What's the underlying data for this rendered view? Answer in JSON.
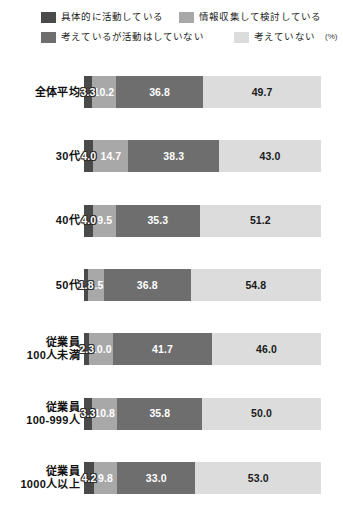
{
  "legend": {
    "items": [
      {
        "label": "具体的に活動している",
        "color": "#4a4a4a"
      },
      {
        "label": "情報収集して検討している",
        "color": "#a8a8a8"
      },
      {
        "label": "考えているが活動はしていない",
        "color": "#6e6e6e"
      },
      {
        "label": "考えていない",
        "color": "#dcdcdc"
      }
    ],
    "unit_note": "(%)"
  },
  "chart_data": {
    "type": "bar",
    "title": "",
    "subtype": "horizontal-100-percent-stacked",
    "xlabel": "",
    "ylabel": "",
    "unit": "%",
    "xlim": [
      0,
      100
    ],
    "grid": false,
    "legend_position": "top",
    "categories": [
      "全体平均",
      "30代",
      "40代",
      "50代",
      "従業員100人未満",
      "従業員100-999人",
      "従業員1000人以上"
    ],
    "category_lines": [
      [
        "全体平均"
      ],
      [
        "30代"
      ],
      [
        "40代"
      ],
      [
        "50代"
      ],
      [
        "従業員",
        "100人未満"
      ],
      [
        "従業員",
        "100-999人"
      ],
      [
        "従業員",
        "1000人以上"
      ]
    ],
    "series": [
      {
        "name": "具体的に活動している",
        "color": "#4a4a4a",
        "values": [
          3.3,
          4.0,
          4.0,
          1.8,
          2.3,
          3.3,
          4.2
        ]
      },
      {
        "name": "情報収集して検討している",
        "color": "#a8a8a8",
        "values": [
          10.2,
          14.7,
          9.5,
          6.5,
          10.0,
          10.8,
          9.8
        ]
      },
      {
        "name": "考えているが活動はしていない",
        "color": "#6e6e6e",
        "values": [
          36.8,
          38.3,
          35.3,
          36.8,
          41.7,
          35.8,
          33.0
        ]
      },
      {
        "name": "考えていない",
        "color": "#dcdcdc",
        "values": [
          49.7,
          43.0,
          51.2,
          54.8,
          46.0,
          50.0,
          53.0
        ]
      }
    ],
    "value_labels": [
      [
        "3.3",
        "10.2",
        "36.8",
        "49.7"
      ],
      [
        "4.0",
        "14.7",
        "38.3",
        "43.0"
      ],
      [
        "4.0",
        "9.5",
        "35.3",
        "51.2"
      ],
      [
        "1.8",
        "6.5",
        "36.8",
        "54.8"
      ],
      [
        "2.3",
        "10.0",
        "41.7",
        "46.0"
      ],
      [
        "3.3",
        "10.8",
        "35.8",
        "50.0"
      ],
      [
        "4.2",
        "9.8",
        "33.0",
        "53.0"
      ]
    ]
  }
}
